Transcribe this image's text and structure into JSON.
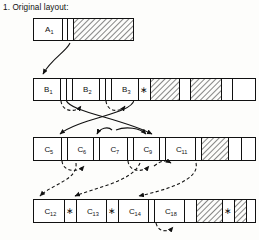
{
  "title": "1. Original layout:",
  "diagram": {
    "type": "memory-layout-compaction-diagram",
    "colors": {
      "stroke": "#111111",
      "background": "#fdfdfb",
      "hatch": "#111111"
    },
    "rows": [
      {
        "id": "row-a",
        "y": 18,
        "height": 22,
        "x": 33,
        "width": 100,
        "cells": [
          {
            "label": "A",
            "sub": "1",
            "x": 33,
            "w": 29,
            "fill": "empty"
          },
          {
            "label": "",
            "sub": "",
            "x": 62,
            "w": 5,
            "fill": "empty"
          },
          {
            "label": "",
            "sub": "",
            "x": 67,
            "w": 6,
            "fill": "empty"
          },
          {
            "label": "",
            "sub": "",
            "x": 73,
            "w": 60,
            "fill": "hatched"
          }
        ]
      },
      {
        "id": "row-b",
        "y": 78,
        "height": 22,
        "x": 33,
        "width": 222,
        "cells": [
          {
            "label": "B",
            "sub": "1",
            "x": 33,
            "w": 27,
            "fill": "empty"
          },
          {
            "label": "",
            "sub": "",
            "x": 60,
            "w": 6,
            "fill": "empty"
          },
          {
            "label": "",
            "sub": "",
            "x": 66,
            "w": 6,
            "fill": "empty"
          },
          {
            "label": "B",
            "sub": "2",
            "x": 72,
            "w": 27,
            "fill": "empty"
          },
          {
            "label": "",
            "sub": "",
            "x": 99,
            "w": 6,
            "fill": "empty"
          },
          {
            "label": "",
            "sub": "",
            "x": 105,
            "w": 6,
            "fill": "empty"
          },
          {
            "label": "B",
            "sub": "3",
            "x": 111,
            "w": 27,
            "fill": "empty"
          },
          {
            "label": "*",
            "sub": "",
            "x": 138,
            "w": 12,
            "fill": "empty"
          },
          {
            "label": "",
            "sub": "",
            "x": 150,
            "w": 29,
            "fill": "hatched"
          },
          {
            "label": "",
            "sub": "",
            "x": 179,
            "w": 11,
            "fill": "empty"
          },
          {
            "label": "",
            "sub": "",
            "x": 190,
            "w": 31,
            "fill": "hatched"
          },
          {
            "label": "",
            "sub": "",
            "x": 221,
            "w": 11,
            "fill": "empty"
          },
          {
            "label": "",
            "sub": "",
            "x": 232,
            "w": 23,
            "fill": "empty"
          }
        ]
      },
      {
        "id": "row-c",
        "y": 137,
        "height": 23,
        "x": 33,
        "width": 222,
        "cells": [
          {
            "label": "C",
            "sub": "5",
            "x": 33,
            "w": 28,
            "fill": "empty"
          },
          {
            "label": "",
            "sub": "",
            "x": 61,
            "w": 6,
            "fill": "empty"
          },
          {
            "label": "C",
            "sub": "6",
            "x": 67,
            "w": 26,
            "fill": "empty"
          },
          {
            "label": "",
            "sub": "",
            "x": 93,
            "w": 6,
            "fill": "empty"
          },
          {
            "label": "C",
            "sub": "7",
            "x": 99,
            "w": 28,
            "fill": "empty"
          },
          {
            "label": "",
            "sub": "",
            "x": 127,
            "w": 6,
            "fill": "empty"
          },
          {
            "label": "C",
            "sub": "9",
            "x": 133,
            "w": 26,
            "fill": "empty"
          },
          {
            "label": "",
            "sub": "",
            "x": 159,
            "w": 6,
            "fill": "empty"
          },
          {
            "label": "C",
            "sub": "11",
            "x": 165,
            "w": 30,
            "fill": "empty"
          },
          {
            "label": "",
            "sub": "",
            "x": 195,
            "w": 6,
            "fill": "empty"
          },
          {
            "label": "",
            "sub": "",
            "x": 201,
            "w": 27,
            "fill": "hatched"
          },
          {
            "label": "",
            "sub": "",
            "x": 228,
            "w": 13,
            "fill": "empty"
          },
          {
            "label": "",
            "sub": "",
            "x": 241,
            "w": 14,
            "fill": "empty"
          }
        ]
      },
      {
        "id": "row-d",
        "y": 199,
        "height": 23,
        "x": 33,
        "width": 222,
        "cells": [
          {
            "label": "C",
            "sub": "12",
            "x": 33,
            "w": 31,
            "fill": "empty"
          },
          {
            "label": "*",
            "sub": "",
            "x": 64,
            "w": 12,
            "fill": "empty"
          },
          {
            "label": "C",
            "sub": "13",
            "x": 76,
            "w": 30,
            "fill": "empty"
          },
          {
            "label": "*",
            "sub": "",
            "x": 106,
            "w": 12,
            "fill": "empty"
          },
          {
            "label": "C",
            "sub": "14",
            "x": 118,
            "w": 30,
            "fill": "empty"
          },
          {
            "label": "",
            "sub": "",
            "x": 148,
            "w": 6,
            "fill": "empty"
          },
          {
            "label": "C",
            "sub": "18",
            "x": 154,
            "w": 30,
            "fill": "empty"
          },
          {
            "label": "",
            "sub": "",
            "x": 184,
            "w": 12,
            "fill": "empty"
          },
          {
            "label": "",
            "sub": "",
            "x": 196,
            "w": 26,
            "fill": "hatched"
          },
          {
            "label": "*",
            "sub": "",
            "x": 222,
            "w": 12,
            "fill": "empty"
          },
          {
            "label": "",
            "sub": "",
            "x": 234,
            "w": 12,
            "fill": "hatched"
          },
          {
            "label": "",
            "sub": "",
            "x": 246,
            "w": 9,
            "fill": "empty"
          }
        ]
      }
    ],
    "solid_arrows": [
      {
        "id": "a1-to-b1",
        "d": "M 70,43 C 66,52 52,58 43,74"
      },
      {
        "id": "b-cross-left",
        "d": "M 66,100 C 70,112 120,118 152,134"
      },
      {
        "id": "b-cross-right",
        "d": "M 134,100 C 132,114 80,118 60,134"
      },
      {
        "id": "c-in-left",
        "d": "M 112,130 C 108,126 100,128 97,134"
      },
      {
        "id": "c-in-right",
        "d": "M 116,130 C 126,126 140,128 146,134"
      }
    ],
    "dashed_arrows": [
      {
        "id": "b1-arc",
        "d": "M 61,101 C 62,112 76,113 81,106"
      },
      {
        "id": "b2-arc",
        "d": "M 106,101 C 107,112 120,113 125,106"
      },
      {
        "id": "c5-arc",
        "d": "M 62,161 C 63,172 78,173 84,166"
      },
      {
        "id": "c7-arc",
        "d": "M 128,161 C 129,172 143,173 149,166"
      },
      {
        "id": "c5-to-d12",
        "d": "M 76,163 C 78,180 52,184 40,196"
      },
      {
        "id": "c7-to-d13",
        "d": "M 140,163 C 132,182 94,188 75,196"
      },
      {
        "id": "c9-to-c11",
        "d": "M 154,166 C 162,160 166,160 171,163"
      },
      {
        "id": "c11-to-d14",
        "d": "M 196,163 C 200,180 166,190 139,196"
      },
      {
        "id": "d18-hook",
        "d": "M 156,223 C 158,232 168,233 173,227"
      }
    ]
  }
}
